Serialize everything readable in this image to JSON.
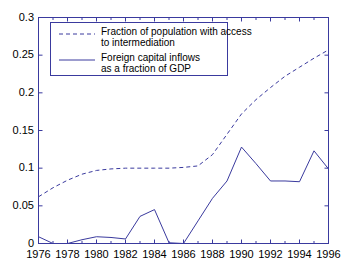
{
  "chart_data": {
    "type": "line",
    "title": "",
    "xlabel": "",
    "ylabel": "",
    "xlim": [
      1976,
      1996
    ],
    "ylim": [
      0,
      0.3
    ],
    "grid": false,
    "legend_position": "top-left",
    "x": [
      1976,
      1977,
      1978,
      1979,
      1980,
      1981,
      1982,
      1983,
      1984,
      1985,
      1986,
      1987,
      1988,
      1989,
      1990,
      1991,
      1992,
      1993,
      1994,
      1995,
      1996
    ],
    "xticks": [
      1976,
      1978,
      1980,
      1982,
      1984,
      1986,
      1988,
      1990,
      1992,
      1994,
      1996
    ],
    "xticklabels": [
      "1976",
      "1978",
      "1980",
      "1982",
      "1984",
      "1986",
      "1988",
      "1990",
      "1992",
      "1994",
      "1996"
    ],
    "yticks": [
      0,
      0.05,
      0.1,
      0.15,
      0.2,
      0.25,
      0.3
    ],
    "yticklabels": [
      "0",
      "0.05",
      "0.1",
      "0.15",
      "0.2",
      "0.25",
      "0.3"
    ],
    "series": [
      {
        "name": "Fraction of population with access to intermediation",
        "style": "dashed",
        "color": "#3a3a9e",
        "values": [
          0.062,
          0.074,
          0.084,
          0.092,
          0.097,
          0.099,
          0.1,
          0.1,
          0.1,
          0.1,
          0.101,
          0.103,
          0.118,
          0.145,
          0.172,
          0.191,
          0.207,
          0.222,
          0.234,
          0.246,
          0.257
        ]
      },
      {
        "name": "Foreign capital inflows as a fraction of GDP",
        "style": "solid",
        "color": "#3a3a9e",
        "values": [
          0.009,
          0.0,
          0.0,
          0.005,
          0.009,
          0.008,
          0.006,
          0.036,
          0.045,
          0.001,
          0.0,
          0.03,
          0.06,
          0.083,
          0.128,
          0.106,
          0.083,
          0.083,
          0.082,
          0.123,
          0.099
        ]
      }
    ],
    "legend": [
      {
        "label_line1": "Fraction of population with access",
        "label_line2": "to intermediation",
        "style": "dashed"
      },
      {
        "label_line1": "Foreign capital inflows",
        "label_line2": "as a fraction of GDP",
        "style": "solid"
      }
    ]
  },
  "axes": {
    "frame_color": "#3a3a9e",
    "tick_color": "#3a3a9e"
  }
}
